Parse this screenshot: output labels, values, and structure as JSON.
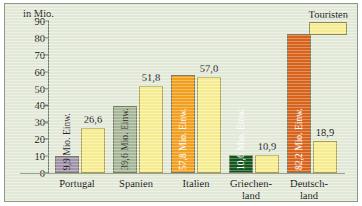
{
  "chart_data": {
    "type": "bar",
    "title": "",
    "ylabel": "in Mio.",
    "xlabel": "",
    "ylim": [
      0,
      90
    ],
    "yticks": [
      90,
      80,
      70,
      60,
      50,
      40,
      30,
      20,
      10,
      0
    ],
    "grid": false,
    "legend": {
      "position": "top-right",
      "entries": [
        "Touristen"
      ]
    },
    "categories": [
      "Portugal",
      "Spanien",
      "Italien",
      "Griechen-land",
      "Deutsch-land"
    ],
    "series": [
      {
        "name": "Einwohner",
        "values": [
          9.9,
          39.6,
          57.8,
          10.6,
          82.2
        ],
        "labels": [
          "9,9 Mio. Einw.",
          "39,6 Mio. Einw.",
          "57,8 Mio. Einw.",
          "10,6 Mio. Einw.",
          "82,2 Mio. Einw."
        ],
        "colors": [
          "#a294ad",
          "#a8b89a",
          "#f5a01e",
          "#11571d",
          "#d9641c"
        ],
        "label_colors": [
          "#2a2330",
          "#2b3326",
          "#ffffff",
          "#ffffff",
          "#ffffff"
        ]
      },
      {
        "name": "Touristen",
        "values": [
          26.6,
          51.8,
          57.0,
          10.9,
          18.9
        ],
        "labels": [
          "26,6",
          "51,8",
          "57,0",
          "10,9",
          "18,9"
        ],
        "color": "#f8ee92"
      }
    ]
  },
  "axis": {
    "unit_caption": "in Mio."
  },
  "legend": {
    "touristen_label": "Touristen"
  },
  "categories": {
    "portugal": "Portugal",
    "spanien": "Spanien",
    "italien": "Italien",
    "griechenland_line1": "Griechen-",
    "griechenland_line2": "land",
    "deutschland_line1": "Deutsch-",
    "deutschland_line2": "land"
  },
  "bars": {
    "portugal_pop": "9,9 Mio. Einw.",
    "portugal_tour": "26,6",
    "spanien_pop": "39,6 Mio. Einw.",
    "spanien_tour": "51,8",
    "italien_pop": "57,8 Mio. Einw.",
    "italien_tour": "57,0",
    "griechenland_pop": "10,6 Mio. Einw.",
    "griechenland_tour": "10,9",
    "deutschland_pop": "82,2 Mio. Einw.",
    "deutschland_tour": "18,9"
  },
  "yticks": {
    "t90": "90",
    "t80": "80",
    "t70": "70",
    "t60": "60",
    "t50": "50",
    "t40": "40",
    "t30": "30",
    "t20": "20",
    "t10": "10",
    "t0": "0"
  }
}
